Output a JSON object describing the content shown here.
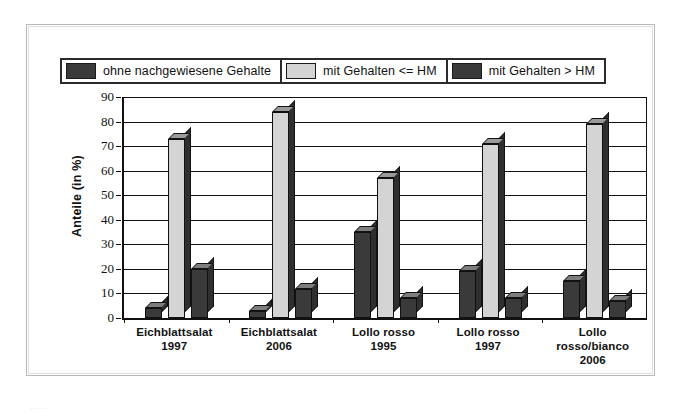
{
  "figure": {
    "legend": [
      {
        "label": "ohne nachgewiesene Gehalte",
        "swatch": "dark-swatch-icon",
        "color": "#3a3a3a"
      },
      {
        "label": "mit Gehalten <= HM",
        "swatch": "light-swatch-icon",
        "color": "#d4d4d4"
      },
      {
        "label": "mit Gehalten > HM",
        "swatch": "dark-swatch-icon",
        "color": "#3a3a3a"
      }
    ],
    "caption_partial": "....."
  },
  "chart_data": {
    "type": "bar",
    "title": "",
    "xlabel": "",
    "ylabel": "Anteile (in %)",
    "ylim": [
      0,
      90
    ],
    "ytick_step": 10,
    "yticks": [
      "90",
      "80",
      "70",
      "60",
      "50",
      "40",
      "30",
      "20",
      "10",
      "0"
    ],
    "grid": true,
    "legend_position": "top",
    "style": "3d-clustered-column",
    "categories": [
      "Eichblattsalat\n1997",
      "Eichblattsalat\n2006",
      "Lollo rosso\n1995",
      "Lollo rosso\n1997",
      "Lollo\nrosso/bianco\n2006"
    ],
    "category_lines": [
      [
        "Eichblattsalat",
        "1997"
      ],
      [
        "Eichblattsalat",
        "2006"
      ],
      [
        "Lollo rosso",
        "1995"
      ],
      [
        "Lollo rosso",
        "1997"
      ],
      [
        "Lollo",
        "rosso/bianco",
        "2006"
      ]
    ],
    "series": [
      {
        "name": "ohne nachgewiesene Gehalte",
        "color": "#3a3a3a",
        "values": [
          4,
          3,
          35,
          19,
          15
        ]
      },
      {
        "name": "mit Gehalten <= HM",
        "color": "#d4d4d4",
        "values": [
          73,
          84,
          57,
          71,
          79
        ]
      },
      {
        "name": "mit Gehalten > HM",
        "color": "#3a3a3a",
        "values": [
          20,
          12,
          8,
          8,
          7
        ]
      }
    ]
  }
}
